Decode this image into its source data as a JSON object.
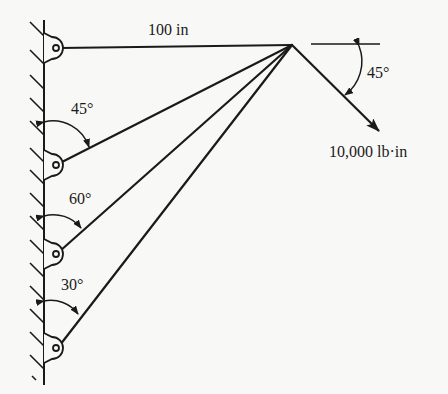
{
  "diagram": {
    "type": "statics-truss-diagram",
    "colors": {
      "ink": "#1a1a1a",
      "background": "#f8f8f6"
    },
    "labels": {
      "top_bar_length": "100 in",
      "angle_bar2": "45°",
      "angle_bar3": "60°",
      "angle_bar4": "30°",
      "load_angle": "45°",
      "load_magnitude": "10,000 lb·in"
    },
    "wall": {
      "x": 44,
      "y_top": 20,
      "y_bottom": 385
    },
    "joint": {
      "x": 292,
      "y": 45
    },
    "supports": [
      {
        "name": "pin-1",
        "x": 56,
        "y": 48
      },
      {
        "name": "pin-2",
        "x": 56,
        "y": 165
      },
      {
        "name": "pin-3",
        "x": 56,
        "y": 254
      },
      {
        "name": "pin-4",
        "x": 56,
        "y": 348
      }
    ],
    "bars": [
      {
        "from": "pin-1",
        "to": "joint",
        "angle_from_wall": "90°"
      },
      {
        "from": "pin-2",
        "to": "joint",
        "angle_from_wall": "45°"
      },
      {
        "from": "pin-3",
        "to": "joint",
        "angle_from_wall": "60°"
      },
      {
        "from": "pin-4",
        "to": "joint",
        "angle_from_wall": "30°"
      }
    ],
    "load": {
      "kind": "moment-vector",
      "direction": "down-right at 45° below horizontal",
      "magnitude": "10,000 lb·in"
    }
  }
}
